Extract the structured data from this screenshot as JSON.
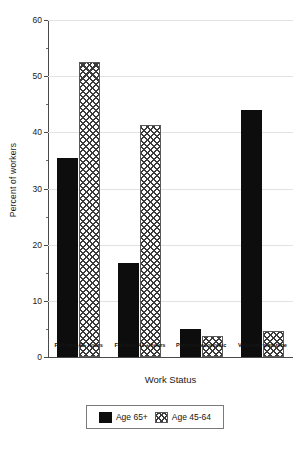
{
  "chart_data": {
    "type": "bar",
    "title": "",
    "xlabel": "Work Status",
    "ylabel": "Percent of workers",
    "categories": [
      "Full-time,40- hours",
      "Full-time,41 + hours",
      "Part-time,economic",
      "Voluntary part-time"
    ],
    "series": [
      {
        "name": "Age 65+",
        "values": [
          35.5,
          16.7,
          5.0,
          44.0
        ]
      },
      {
        "name": "Age 45-64",
        "values": [
          52.5,
          41.3,
          3.8,
          4.6
        ]
      }
    ],
    "ylim": [
      0,
      60
    ],
    "yticks": [
      0,
      10,
      20,
      30,
      40,
      50,
      60
    ],
    "ytick_labels": [
      "0",
      "10",
      "20",
      "30",
      "40",
      "50",
      "60"
    ],
    "yminor_ticks": [
      5,
      15,
      25,
      35,
      45,
      55
    ],
    "grid": true,
    "legend_position": "below-center"
  },
  "legend": {
    "entries": [
      {
        "label": "Age 65+",
        "swatch": "solid-black-swatch"
      },
      {
        "label": "Age 45-64",
        "swatch": "cross-hatch-swatch"
      }
    ]
  },
  "colors": {
    "series_1": "#0d0d0d",
    "series_2_hatch": "#3b3b3b",
    "axis": "#4a4a4a",
    "grid": "#e2e2e2",
    "background": "#ffffff"
  }
}
